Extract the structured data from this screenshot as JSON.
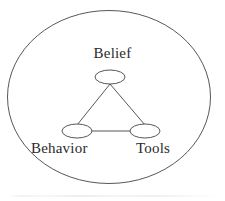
{
  "diagram": {
    "type": "venn-triangle-concept-diagram",
    "background_color": "#ffffff",
    "stroke_color": "#444444",
    "text_color": "#2b2b2b",
    "outer_boundary": {
      "shape": "ellipse",
      "center_x": 109,
      "center_y": 97,
      "radius_x": 102,
      "radius_y": 87
    },
    "nodes": [
      {
        "id": "belief",
        "label": "Belief",
        "shape": "ellipse",
        "center_x": 110,
        "center_y": 77,
        "radius_x": 15,
        "radius_y": 7,
        "label_position": "above"
      },
      {
        "id": "behavior",
        "label": "Behavior",
        "shape": "ellipse",
        "center_x": 77,
        "center_y": 131,
        "radius_x": 15,
        "radius_y": 7,
        "label_position": "below"
      },
      {
        "id": "tools",
        "label": "Tools",
        "shape": "ellipse",
        "center_x": 145,
        "center_y": 131,
        "radius_x": 15,
        "radius_y": 7,
        "label_position": "below"
      }
    ],
    "edges": [
      {
        "id": "belief-behavior",
        "from": "belief",
        "to": "behavior"
      },
      {
        "id": "belief-tools",
        "from": "belief",
        "to": "tools"
      },
      {
        "id": "behavior-tools",
        "from": "behavior",
        "to": "tools"
      }
    ]
  }
}
